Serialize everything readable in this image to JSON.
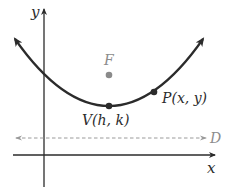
{
  "diagram": {
    "axes": {
      "x_label": "x",
      "y_label": "y"
    },
    "points": {
      "focus": {
        "label": "F"
      },
      "vertex": {
        "label": "V(h, k)"
      },
      "point": {
        "label": "P(x, y)"
      }
    },
    "directrix": {
      "label": "D"
    },
    "colors": {
      "curve": "#2b2b2b",
      "axis": "#2b2b2b",
      "focus": "#8a8a8a",
      "directrix": "#9a9a9a",
      "label_gray": "#8c8c8c"
    }
  }
}
